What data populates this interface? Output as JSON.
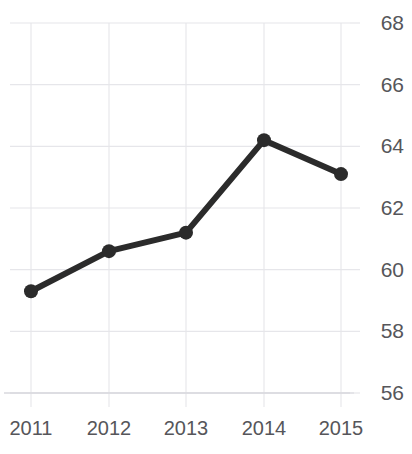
{
  "chart_data": {
    "type": "line",
    "title": "",
    "xlabel": "",
    "ylabel": "",
    "categories": [
      "2011",
      "2012",
      "2013",
      "2014",
      "2015"
    ],
    "x": [
      2011,
      2012,
      2013,
      2014,
      2015
    ],
    "values": [
      59.3,
      60.6,
      61.2,
      64.2,
      63.1
    ],
    "series": [
      {
        "name": "",
        "values": [
          59.3,
          60.6,
          61.2,
          64.2,
          63.1
        ]
      }
    ],
    "ylim": [
      56,
      68
    ],
    "yticks": [
      56,
      58,
      60,
      62,
      64,
      66,
      68
    ],
    "ytick_labels": [
      "56",
      "58",
      "60",
      "62",
      "64",
      "66",
      "68"
    ],
    "xtick_labels": [
      "2011",
      "2012",
      "2013",
      "2014",
      "2015"
    ],
    "y_axis_position": "right",
    "grid": true,
    "grid_axis": "both",
    "legend": false,
    "legend_position": "none",
    "markers": "circle",
    "colors": {
      "line": "#2b2b2b",
      "marker": "#2b2b2b",
      "grid": "#e6e6ea",
      "axis": "#dcdce0",
      "tick_label": "#56565a",
      "background": "#ffffff"
    },
    "style": {
      "line_width": 6,
      "marker_radius": 7
    }
  }
}
